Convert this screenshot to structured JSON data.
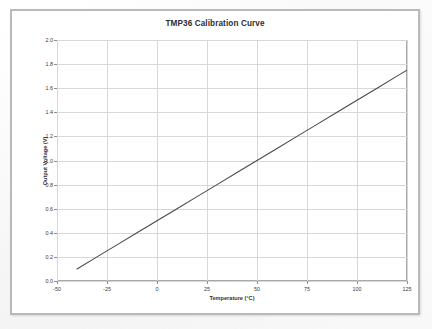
{
  "chart_data": {
    "type": "line",
    "title": "TMP36 Calibration Curve",
    "xlabel": "Temperature (°C)",
    "ylabel": "Output Voltage (V)",
    "xlim": [
      -50,
      125
    ],
    "ylim": [
      0.0,
      2.0
    ],
    "xticks": [
      -50,
      -25,
      0,
      25,
      50,
      75,
      100,
      125
    ],
    "xtick_labels": [
      "-50",
      "-25",
      "0",
      "25",
      "50",
      "75",
      "100",
      "125"
    ],
    "yticks": [
      0.0,
      0.2,
      0.4,
      0.6,
      0.8,
      1.0,
      1.2,
      1.4,
      1.6,
      1.8,
      2.0
    ],
    "ytick_labels": [
      "0.0",
      "0.2",
      "0.4",
      "0.6",
      "0.8",
      "1.0",
      "1.2",
      "1.4",
      "1.6",
      "1.8",
      "2.0"
    ],
    "grid": true,
    "legend": false,
    "series": [
      {
        "name": "TMP36 output",
        "color": "#4a4a4a",
        "line_width": 1.1,
        "x": [
          -40,
          -30,
          -20,
          -10,
          0,
          10,
          20,
          25,
          30,
          40,
          50,
          60,
          70,
          75,
          80,
          90,
          100,
          110,
          120,
          125
        ],
        "y": [
          0.1,
          0.2,
          0.3,
          0.4,
          0.5,
          0.6,
          0.7,
          0.75,
          0.8,
          0.9,
          1.0,
          1.1,
          1.2,
          1.25,
          1.3,
          1.4,
          1.5,
          1.6,
          1.7,
          1.75
        ]
      }
    ]
  },
  "figure": {
    "frame_color": "#b9b9b9",
    "plot_border_color": "#a8a8a8",
    "grid_color": "#d7d7d7",
    "background": "#ffffff"
  }
}
